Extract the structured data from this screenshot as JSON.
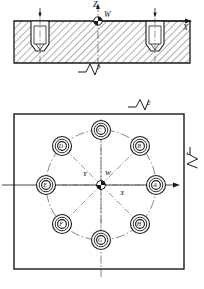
{
  "drawing": {
    "title": "Machined plate with bolt-circle holes",
    "views": {
      "section": {
        "name": "section-view",
        "axis_z_label": "Z",
        "axis_x_label": "X",
        "origin_label": "W",
        "surface_finish_label": "3"
      },
      "plan": {
        "name": "plan-view",
        "axis_y_label": "Y",
        "axis_x_label": "X",
        "origin_label": "W",
        "surface_finish_top_label": "2",
        "surface_finish_right_label": "4"
      }
    },
    "holes": [
      {
        "id": "A",
        "label": "A",
        "cx": 155,
        "cy": 185
      },
      {
        "id": "B",
        "label": "B",
        "cx": 136,
        "cy": 148
      },
      {
        "id": "C",
        "label": "C",
        "cx": 101,
        "cy": 129
      },
      {
        "id": "D",
        "label": "D",
        "cx": 65,
        "cy": 148
      },
      {
        "id": "E",
        "label": "E",
        "cx": 47,
        "cy": 185
      },
      {
        "id": "F",
        "label": "F",
        "cx": 65,
        "cy": 222
      },
      {
        "id": "G",
        "label": "G",
        "cx": 101,
        "cy": 241
      },
      {
        "id": "H",
        "label": "H",
        "cx": 136,
        "cy": 222
      }
    ],
    "colors": {
      "line": "#1a1a1a",
      "hatch": "#1a1a1a",
      "background": "#ffffff",
      "thin": "#333333"
    }
  }
}
